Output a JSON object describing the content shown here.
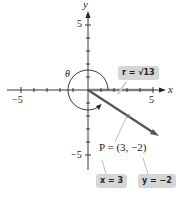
{
  "diagram": {
    "axes": {
      "x_label": "x",
      "y_label": "y",
      "x_tick_pos_label": "5",
      "x_tick_neg_label": "−5",
      "y_tick_pos_label": "5",
      "y_tick_neg_label": "−5",
      "range": [
        -5,
        5
      ]
    },
    "angle_label": "θ",
    "point_label": "P = (3, −2)",
    "point": {
      "x": 3,
      "y": -2
    },
    "callouts": {
      "r": "r = √13",
      "x": "x = 3",
      "y": "y = −2"
    },
    "colors": {
      "axis": "#222222",
      "terminal_ray": "#555555",
      "highlight_x_segment": "#c8c8c8",
      "callout_bg": "#d6d6d6"
    }
  }
}
